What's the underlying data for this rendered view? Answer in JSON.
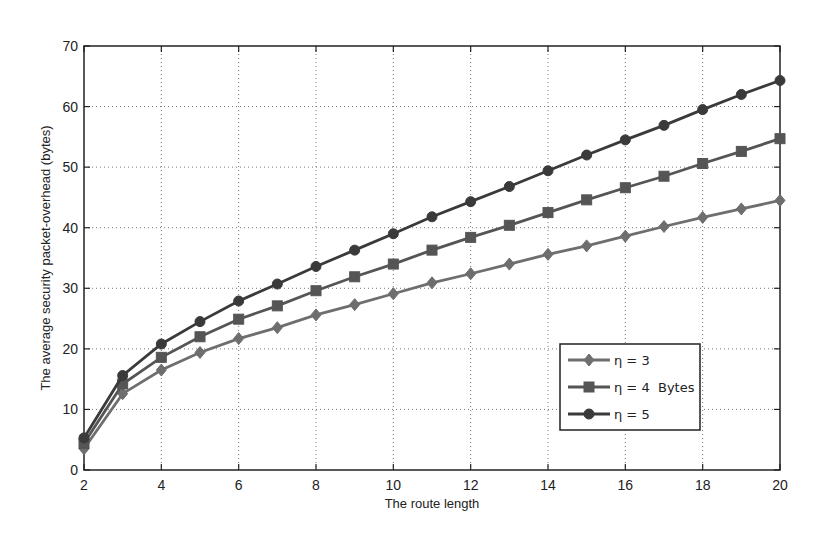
{
  "chart_data": {
    "type": "line",
    "title": "",
    "xlabel": "The route length",
    "ylabel": "The average security packet-overhead (bytes)",
    "xlim": [
      2,
      20
    ],
    "ylim": [
      0,
      70
    ],
    "xticks": [
      2,
      4,
      6,
      8,
      10,
      12,
      14,
      16,
      18,
      20
    ],
    "yticks": [
      0,
      10,
      20,
      30,
      40,
      50,
      60,
      70
    ],
    "grid": true,
    "legend_position": "lower right (inside)",
    "legend_note": "Bytes",
    "x": [
      2,
      3,
      4,
      5,
      6,
      7,
      8,
      9,
      10,
      11,
      12,
      13,
      14,
      15,
      16,
      17,
      18,
      19,
      20
    ],
    "series": [
      {
        "name": "η = 3",
        "marker": "diamond",
        "color": "#6e6e6e",
        "values": [
          3.5,
          12.6,
          16.5,
          19.4,
          21.7,
          23.5,
          25.6,
          27.3,
          29.1,
          30.9,
          32.4,
          34.0,
          35.6,
          37.0,
          38.6,
          40.2,
          41.7,
          43.1,
          44.5
        ]
      },
      {
        "name": "η = 4",
        "marker": "square",
        "color": "#555555",
        "values": [
          4.4,
          14.2,
          18.6,
          22.0,
          24.9,
          27.1,
          29.6,
          31.9,
          34.0,
          36.3,
          38.4,
          40.4,
          42.5,
          44.6,
          46.6,
          48.5,
          50.6,
          52.6,
          54.7
        ]
      },
      {
        "name": "η = 5",
        "marker": "circle",
        "color": "#3a3a3a",
        "values": [
          5.3,
          15.6,
          20.8,
          24.5,
          27.9,
          30.7,
          33.6,
          36.3,
          39.0,
          41.8,
          44.3,
          46.8,
          49.4,
          52.0,
          54.5,
          56.9,
          59.5,
          62.0,
          64.3
        ]
      }
    ]
  }
}
